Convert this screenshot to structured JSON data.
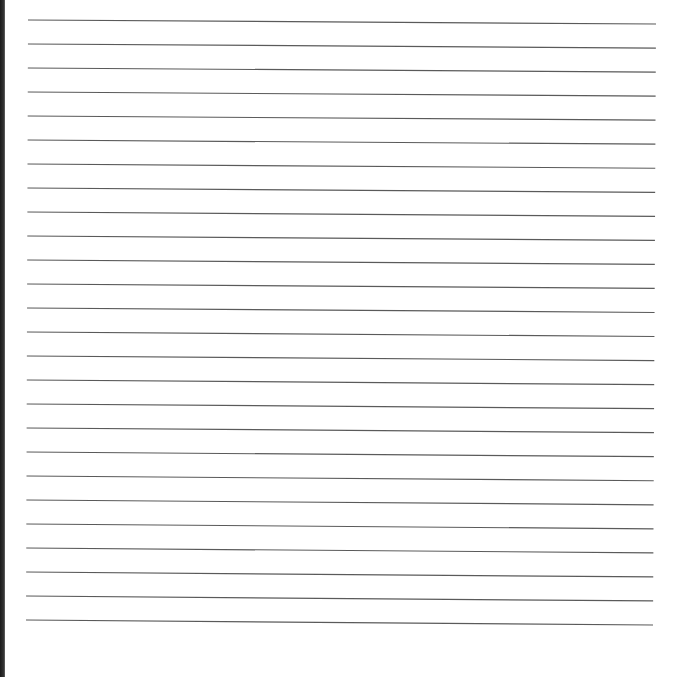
{
  "page": {
    "type": "lined-paper",
    "background": "#ffffff",
    "line_color": "#5a5a5a",
    "left_edge_color": "#1f1f1f",
    "line_count": 26,
    "lines": {
      "first_left_y": 20,
      "first_right_y": 24,
      "spacing": 24,
      "left_x": 28,
      "right_x": 656
    }
  }
}
